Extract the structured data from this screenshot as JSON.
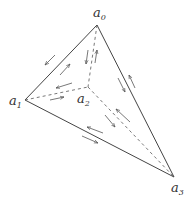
{
  "diagram": {
    "type": "tetrahedron",
    "vertices": [
      {
        "id": "a0",
        "label": "a",
        "sub": "0",
        "x": 97,
        "y": 25
      },
      {
        "id": "a1",
        "label": "a",
        "sub": "1",
        "x": 25,
        "y": 100
      },
      {
        "id": "a2",
        "label": "a",
        "sub": "2",
        "x": 88,
        "y": 87
      },
      {
        "id": "a3",
        "label": "a",
        "sub": "3",
        "x": 174,
        "y": 177
      }
    ],
    "edges": [
      {
        "from": "a0",
        "to": "a1",
        "style": "solid"
      },
      {
        "from": "a0",
        "to": "a3",
        "style": "solid"
      },
      {
        "from": "a1",
        "to": "a3",
        "style": "solid"
      },
      {
        "from": "a0",
        "to": "a2",
        "style": "dashed"
      },
      {
        "from": "a1",
        "to": "a2",
        "style": "dashed"
      },
      {
        "from": "a2",
        "to": "a3",
        "style": "dashed"
      }
    ],
    "colors": {
      "line": "#444444",
      "arrow": "#555555",
      "text": "#333333"
    }
  }
}
